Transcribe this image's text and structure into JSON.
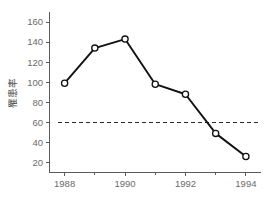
{
  "chart_data": {
    "type": "line",
    "title": "",
    "xlabel": "",
    "ylabel": "罹患率",
    "x": [
      1988,
      1989,
      1990,
      1991,
      1992,
      1993,
      1994
    ],
    "values": [
      99,
      134,
      143,
      98,
      88,
      49,
      26
    ],
    "series": [
      {
        "name": "罹患率",
        "values": [
          99,
          134,
          143,
          98,
          88,
          49,
          26
        ]
      }
    ],
    "xlim": [
      1987.5,
      1994.5
    ],
    "ylim": [
      10,
      168
    ],
    "y_ticks": [
      20,
      40,
      60,
      80,
      100,
      120,
      140,
      160
    ],
    "y_tick_labels": [
      "20",
      "40",
      "60",
      "80",
      "100",
      "120",
      "140",
      "160"
    ],
    "x_ticks": [
      1988,
      1990,
      1992,
      1994
    ],
    "x_tick_labels": [
      "1988",
      "1990",
      "1992",
      "1994"
    ],
    "x_minor_ticks": [
      1989,
      1991,
      1993
    ],
    "grid": false,
    "legend": "none",
    "annotations": [
      {
        "type": "hline",
        "name": "reference-line",
        "value": 60,
        "style": "dashed",
        "label": ""
      }
    ],
    "marker": "open-circle",
    "line_color": "#111111",
    "marker_face_color": "#ffffff",
    "reference_line_color": "#2b2b2b",
    "axis_color": "#5a5a5a",
    "tick_label_color": "#6b6b6b",
    "background_color": "#ffffff"
  }
}
